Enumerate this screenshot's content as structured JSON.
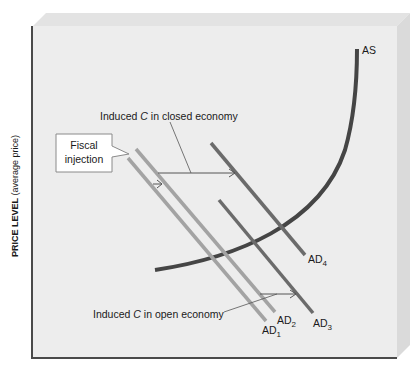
{
  "figure": {
    "y_axis_label_bold": "PRICE LEVEL",
    "y_axis_label_paren": " (average price)",
    "x_axis_label": ""
  },
  "curves": {
    "as_label": "AS",
    "ad1_label": "AD",
    "ad1_sub": "1",
    "ad2_label": "AD",
    "ad2_sub": "2",
    "ad3_label": "AD",
    "ad3_sub": "3",
    "ad4_label": "AD",
    "ad4_sub": "4"
  },
  "annotations": {
    "callout_line1": "Fiscal",
    "callout_line2": "injection",
    "closed_prefix": "Induced ",
    "closed_var": "C",
    "closed_suffix": " in closed economy",
    "open_prefix": "Induced ",
    "open_var": "C",
    "open_suffix": " in open economy"
  },
  "colors": {
    "frame_face": "#ededed",
    "frame_top": "#e2e2e2",
    "frame_side": "#d9d9d9",
    "axis": "#4a4a4a",
    "as_curve": "#454545",
    "ad_light": "#a3a3a3",
    "ad_dark": "#6b6b6b",
    "arrow": "#555555"
  }
}
